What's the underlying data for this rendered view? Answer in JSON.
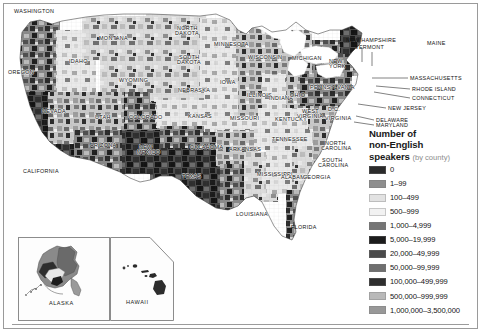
{
  "map": {
    "title": "Number of non-English speakers by county",
    "projection": "United States with Alaska and Hawaii insets",
    "frame_color": "#9a9a9a",
    "ocean_color": "#ffffff",
    "state_labels": [
      {
        "name": "WASHINGTON",
        "x": 16,
        "y": 12
      },
      {
        "name": "OREGON",
        "x": 8,
        "y": 73
      },
      {
        "name": "IDAHO",
        "x": 69,
        "y": 62
      },
      {
        "name": "MONTANA",
        "x": 101,
        "y": 39
      },
      {
        "name": "WYOMING",
        "x": 120,
        "y": 81
      },
      {
        "name": "NEVADA",
        "x": 43,
        "y": 112
      },
      {
        "name": "UTAH",
        "x": 96,
        "y": 118
      },
      {
        "name": "COLORADO",
        "x": 132,
        "y": 119
      },
      {
        "name": "CALIFORNIA",
        "x": 23,
        "y": 172
      },
      {
        "name": "ARIZONA",
        "x": 92,
        "y": 146
      },
      {
        "name": "NEW",
        "x": 140,
        "y": 148
      },
      {
        "name": "MEXICO",
        "x": 139,
        "y": 153
      },
      {
        "name": "NORTH",
        "x": 178,
        "y": 29
      },
      {
        "name": "DAKOTA",
        "x": 177,
        "y": 34
      },
      {
        "name": "SOUTH",
        "x": 180,
        "y": 58
      },
      {
        "name": "DAKOTA",
        "x": 178,
        "y": 63
      },
      {
        "name": "NEBRASKA",
        "x": 180,
        "y": 91
      },
      {
        "name": "KANSAS",
        "x": 189,
        "y": 117
      },
      {
        "name": "OKLAHOMA",
        "x": 192,
        "y": 148
      },
      {
        "name": "TEXAS",
        "x": 183,
        "y": 177
      },
      {
        "name": "MINNESOTA",
        "x": 217,
        "y": 45
      },
      {
        "name": "IOWA",
        "x": 221,
        "y": 83
      },
      {
        "name": "MISSOURI",
        "x": 232,
        "y": 119
      },
      {
        "name": "ARKANSAS",
        "x": 231,
        "y": 150
      },
      {
        "name": "LOUISIANA",
        "x": 237,
        "y": 215
      },
      {
        "name": "WISCONSIN",
        "x": 250,
        "y": 58
      },
      {
        "name": "ILLINOIS",
        "x": 249,
        "y": 96
      },
      {
        "name": "MICHIGAN",
        "x": 295,
        "y": 59
      },
      {
        "name": "INDIANA",
        "x": 271,
        "y": 99
      },
      {
        "name": "OHIO",
        "x": 291,
        "y": 96
      },
      {
        "name": "KENTUCKY",
        "x": 277,
        "y": 120
      },
      {
        "name": "TENNESSEE",
        "x": 274,
        "y": 140
      },
      {
        "name": "MISSISSIPPI",
        "x": 259,
        "y": 175
      },
      {
        "name": "ALABAMA",
        "x": 283,
        "y": 178
      },
      {
        "name": "GEORGIA",
        "x": 305,
        "y": 178
      },
      {
        "name": "FLORIDA",
        "x": 292,
        "y": 228
      },
      {
        "name": "SOUTH",
        "x": 323,
        "y": 161
      },
      {
        "name": "CAROLINA",
        "x": 320,
        "y": 166
      },
      {
        "name": "NORTH",
        "x": 326,
        "y": 144
      },
      {
        "name": "CAROLINA",
        "x": 323,
        "y": 149
      },
      {
        "name": "VIRGINIA",
        "x": 326,
        "y": 119
      },
      {
        "name": "WEST",
        "x": 303,
        "y": 112
      },
      {
        "name": "VIRGINIA",
        "x": 299,
        "y": 117
      },
      {
        "name": "D.C.",
        "x": 329,
        "y": 110
      },
      {
        "name": "PENNSYLVANIA",
        "x": 315,
        "y": 88
      },
      {
        "name": "NEW",
        "x": 330,
        "y": 62
      },
      {
        "name": "YORK",
        "x": 330,
        "y": 67
      }
    ],
    "callout_labels": [
      {
        "name": "NEW HAMPSHIRE",
        "x": 347,
        "y": 40
      },
      {
        "name": "VERMONT",
        "x": 356,
        "y": 46
      },
      {
        "name": "MAINE",
        "x": 428,
        "y": 42
      },
      {
        "name": "MASSACHUSETTS",
        "x": 411,
        "y": 76
      },
      {
        "name": "RHODE ISLAND",
        "x": 413,
        "y": 88
      },
      {
        "name": "CONNECTICUT",
        "x": 413,
        "y": 97
      },
      {
        "name": "NEW JERSEY",
        "x": 389,
        "y": 106
      },
      {
        "name": "DELAWARE",
        "x": 377,
        "y": 118
      },
      {
        "name": "MARYLAND",
        "x": 377,
        "y": 123
      }
    ],
    "insets": [
      {
        "name": "ALASKA",
        "caption": "ALASKA",
        "x": 18,
        "y": 237,
        "w": 92,
        "h": 84
      },
      {
        "name": "HAWAII",
        "caption": "HAWAII",
        "x": 110,
        "y": 237,
        "w": 64,
        "h": 84
      }
    ]
  },
  "legend": {
    "title_line1": "Number of",
    "title_line2": "non-English",
    "title_line3": "speakers",
    "title_sub": "(by county)",
    "entries": [
      {
        "label": "0",
        "color": "#2b2b2b"
      },
      {
        "label": "1–99",
        "color": "#8e8e8e"
      },
      {
        "label": "100–499",
        "color": "#e2e2e2"
      },
      {
        "label": "500–999",
        "color": "#f2f2f2"
      },
      {
        "label": "1,000–4,999",
        "color": "#757575"
      },
      {
        "label": "5,000–19,999",
        "color": "#1c1c1c"
      },
      {
        "label": "20,000–49,999",
        "color": "#4a4a4a"
      },
      {
        "label": "50,000–99,999",
        "color": "#6f6f6f"
      },
      {
        "label": "100,000–499,999",
        "color": "#2e2e2e"
      },
      {
        "label": "500,000–999,999",
        "color": "#b9b9b9"
      },
      {
        "label": "1,000,000–3,500,000",
        "color": "#989898"
      }
    ]
  }
}
